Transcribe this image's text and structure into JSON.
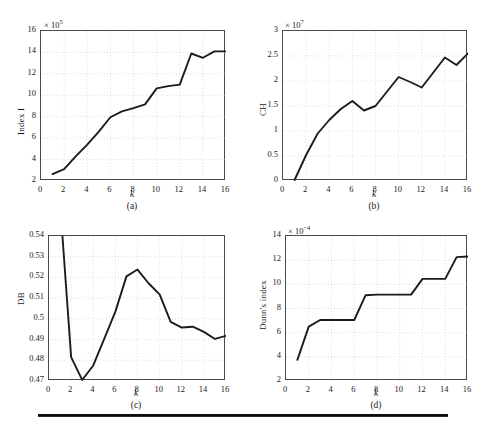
{
  "figure": {
    "background": "#ffffff",
    "line_color": "#1c1c1c",
    "grid_color": "#c9c9c9",
    "axis_color": "#4a4a4a"
  },
  "panels": [
    {
      "id": "a",
      "caption": "(a)",
      "ylabel": "Index I",
      "xlabel": "k",
      "exponent_prefix": "× 10",
      "exponent_value": "5",
      "xticks": [
        "0",
        "2",
        "4",
        "6",
        "8",
        "10",
        "12",
        "14",
        "16"
      ],
      "yticks": [
        "2",
        "4",
        "6",
        "8",
        "10",
        "12",
        "14",
        "16"
      ],
      "chart_data": {
        "type": "line",
        "title": "",
        "xlabel": "k",
        "ylabel": "Index I",
        "y_multiplier": "1e5",
        "xlim": [
          0,
          16
        ],
        "ylim": [
          2,
          16
        ],
        "xticks": [
          0,
          2,
          4,
          6,
          8,
          10,
          12,
          14,
          16
        ],
        "yticks": [
          2,
          4,
          6,
          8,
          10,
          12,
          14,
          16
        ],
        "grid": true,
        "legend": "none",
        "x": [
          1,
          2,
          3,
          4,
          5,
          6,
          7,
          8,
          9,
          10,
          11,
          12,
          13,
          14,
          15,
          16
        ],
        "values": [
          2.65,
          3.1,
          4.3,
          5.4,
          6.6,
          7.95,
          8.5,
          8.8,
          9.15,
          10.65,
          10.85,
          11.0,
          13.9,
          13.5,
          14.1,
          14.1
        ]
      }
    },
    {
      "id": "b",
      "caption": "(b)",
      "ylabel": "CH",
      "xlabel": "k",
      "exponent_prefix": "× 10",
      "exponent_value": "7",
      "xticks": [
        "0",
        "2",
        "4",
        "6",
        "8",
        "10",
        "12",
        "14",
        "16"
      ],
      "yticks": [
        "0",
        "0.5",
        "1",
        "1.5",
        "2",
        "2.5",
        "3"
      ],
      "chart_data": {
        "type": "line",
        "title": "",
        "xlabel": "k",
        "ylabel": "CH",
        "y_multiplier": "1e7",
        "xlim": [
          0,
          16
        ],
        "ylim": [
          0,
          3
        ],
        "xticks": [
          0,
          2,
          4,
          6,
          8,
          10,
          12,
          14,
          16
        ],
        "yticks": [
          0,
          0.5,
          1,
          1.5,
          2,
          2.5,
          3
        ],
        "grid": true,
        "legend": "none",
        "x": [
          1,
          2,
          3,
          4,
          5,
          6,
          7,
          8,
          9,
          10,
          11,
          12,
          13,
          14,
          15,
          16
        ],
        "values": [
          0.02,
          0.52,
          0.95,
          1.22,
          1.44,
          1.6,
          1.41,
          1.5,
          1.79,
          2.08,
          1.98,
          1.87,
          2.17,
          2.47,
          2.32,
          2.55
        ]
      }
    },
    {
      "id": "c",
      "caption": "(c)",
      "ylabel": "DB",
      "xlabel": "k",
      "exponent_prefix": "",
      "exponent_value": "",
      "xticks": [
        "0",
        "2",
        "4",
        "6",
        "8",
        "10",
        "12",
        "14",
        "16"
      ],
      "yticks": [
        "0.47",
        "0.48",
        "0.49",
        "0.5",
        "0.51",
        "0.52",
        "0.53",
        "0.54"
      ],
      "chart_data": {
        "type": "line",
        "title": "",
        "xlabel": "k",
        "ylabel": "DB",
        "y_multiplier": "1",
        "xlim": [
          0,
          16
        ],
        "ylim": [
          0.47,
          0.54
        ],
        "xticks": [
          0,
          2,
          4,
          6,
          8,
          10,
          12,
          14,
          16
        ],
        "yticks": [
          0.47,
          0.48,
          0.49,
          0.5,
          0.51,
          0.52,
          0.53,
          0.54
        ],
        "grid": true,
        "legend": "none",
        "note": "value at k=1 exceeds the top of the axis and is clipped",
        "x": [
          1,
          2,
          3,
          4,
          5,
          6,
          7,
          8,
          9,
          10,
          11,
          12,
          13,
          14,
          15,
          16
        ],
        "values": [
          0.556,
          0.4815,
          0.4705,
          0.4775,
          0.4905,
          0.5035,
          0.5205,
          0.5238,
          0.5172,
          0.5118,
          0.4985,
          0.4958,
          0.4962,
          0.4937,
          0.4903,
          0.4918
        ]
      }
    },
    {
      "id": "d",
      "caption": "(d)",
      "ylabel": "Dunn's index",
      "xlabel": "k",
      "exponent_prefix": "× 10",
      "exponent_value": "−4",
      "xticks": [
        "0",
        "2",
        "4",
        "6",
        "8",
        "10",
        "12",
        "14",
        "16"
      ],
      "yticks": [
        "2",
        "4",
        "6",
        "8",
        "10",
        "12",
        "14"
      ],
      "chart_data": {
        "type": "line",
        "title": "",
        "xlabel": "k",
        "ylabel": "Dunn's index",
        "y_multiplier": "1e-4",
        "xlim": [
          0,
          16
        ],
        "ylim": [
          2,
          14
        ],
        "xticks": [
          0,
          2,
          4,
          6,
          8,
          10,
          12,
          14,
          16
        ],
        "yticks": [
          2,
          4,
          6,
          8,
          10,
          12,
          14
        ],
        "grid": true,
        "legend": "none",
        "x": [
          1,
          2,
          3,
          4,
          5,
          6,
          7,
          8,
          9,
          10,
          11,
          12,
          13,
          14,
          15,
          16
        ],
        "values": [
          3.75,
          6.5,
          7.05,
          7.05,
          7.05,
          7.05,
          9.1,
          9.15,
          9.15,
          9.15,
          9.15,
          10.45,
          10.45,
          10.45,
          12.25,
          12.3
        ]
      }
    }
  ]
}
